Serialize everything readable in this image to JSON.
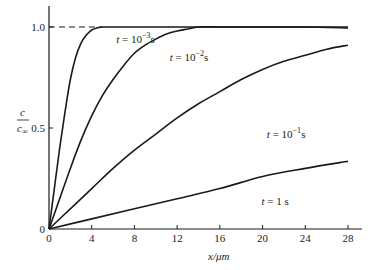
{
  "chart_data": {
    "type": "line",
    "title": "",
    "xlabel": "x/μm",
    "ylabel": "c / c∞",
    "xlim": [
      0,
      29.5
    ],
    "ylim": [
      0,
      1.1
    ],
    "xticks": [
      0,
      4,
      8,
      12,
      16,
      20,
      24,
      28
    ],
    "yticks": [
      0,
      0.5,
      1.0
    ],
    "ytick_labels": [
      "0",
      "0.5",
      "1.0"
    ],
    "grid": false,
    "legend": "inline labels",
    "reference_line": {
      "y": 1.0,
      "style": "dashed",
      "x_range": [
        0,
        5
      ]
    },
    "series": [
      {
        "name": "t = 10^-3 s",
        "label_parts": [
          "t",
          " = 10",
          "−3",
          "s"
        ],
        "label_pos": [
          6.3,
          0.92
        ],
        "x": [
          0,
          0.5,
          1,
          1.5,
          2,
          2.5,
          3,
          3.5,
          4,
          4.5,
          5,
          6,
          8,
          12,
          16,
          20,
          24,
          28
        ],
        "y": [
          0,
          0.2,
          0.4,
          0.58,
          0.74,
          0.85,
          0.92,
          0.96,
          0.985,
          0.995,
          1.0,
          1.0,
          1.0,
          1.0,
          1.0,
          1.0,
          1.0,
          1.0
        ]
      },
      {
        "name": "t = 10^-2 s",
        "label_parts": [
          "t",
          " = 10",
          "−2",
          "s"
        ],
        "label_pos": [
          11.3,
          0.83
        ],
        "x": [
          0,
          1,
          2,
          3,
          4,
          5,
          6,
          7,
          8,
          9,
          10,
          11,
          12,
          13,
          14,
          16,
          20,
          24,
          28
        ],
        "y": [
          0,
          0.15,
          0.3,
          0.44,
          0.56,
          0.66,
          0.74,
          0.81,
          0.87,
          0.91,
          0.94,
          0.965,
          0.98,
          0.99,
          1.0,
          1.0,
          1.0,
          1.0,
          0.995
        ]
      },
      {
        "name": "t = 10^-1 s",
        "label_parts": [
          "t",
          " = 10",
          "−1",
          "s"
        ],
        "label_pos": [
          20.4,
          0.45
        ],
        "x": [
          0,
          2,
          4,
          6,
          8,
          10,
          12,
          14,
          16,
          18,
          20,
          22,
          24,
          26,
          28
        ],
        "y": [
          0,
          0.1,
          0.2,
          0.3,
          0.39,
          0.47,
          0.55,
          0.62,
          0.68,
          0.74,
          0.79,
          0.83,
          0.86,
          0.89,
          0.91
        ]
      },
      {
        "name": "t = 1 s",
        "label_parts": [
          "t",
          " = 1 s",
          "",
          ""
        ],
        "label_pos": [
          19.9,
          0.12
        ],
        "x": [
          0,
          4,
          8,
          12,
          16,
          20,
          24,
          28
        ],
        "y": [
          0,
          0.05,
          0.1,
          0.15,
          0.2,
          0.26,
          0.3,
          0.335
        ]
      }
    ]
  },
  "axes": {
    "xlabel": "x/μm",
    "ylabel_num": "c",
    "ylabel_den": "c",
    "ylabel_den_sub": "∞"
  }
}
